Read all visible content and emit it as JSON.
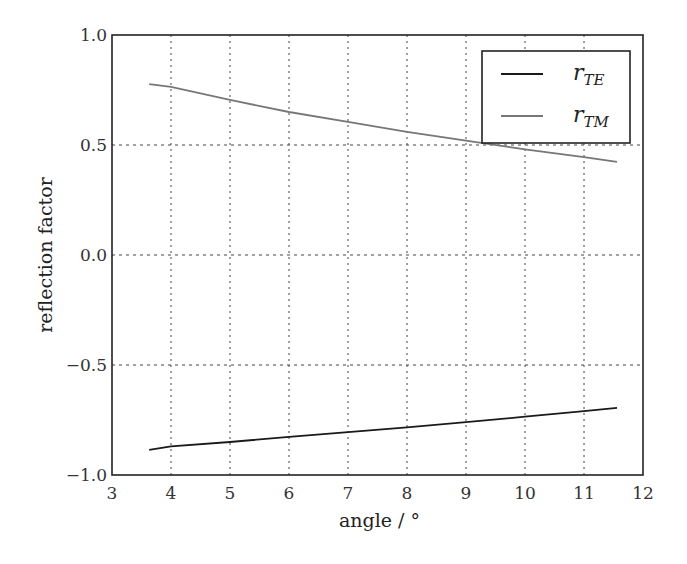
{
  "chart_data": {
    "type": "line",
    "title": "",
    "xlabel": "angle / °",
    "ylabel": "reflection factor",
    "xlim": [
      3,
      12
    ],
    "ylim": [
      -1.0,
      1.0
    ],
    "xticks": [
      "3",
      "4",
      "5",
      "6",
      "7",
      "8",
      "9",
      "10",
      "11",
      "12"
    ],
    "yticks": [
      "1.0",
      "0.5",
      "0.0",
      "−0.5",
      "−1.0"
    ],
    "grid": true,
    "legend_position": "upper right",
    "series": [
      {
        "name": "r_TE",
        "label_main": "r",
        "label_sub": "TE",
        "color": "#1a1a1a",
        "x": [
          3.63,
          4,
          5,
          6,
          7,
          8,
          9,
          10,
          11,
          11.56
        ],
        "y": [
          -0.886,
          -0.87,
          -0.85,
          -0.827,
          -0.805,
          -0.783,
          -0.76,
          -0.735,
          -0.71,
          -0.695
        ]
      },
      {
        "name": "r_TM",
        "label_main": "r",
        "label_sub": "TM",
        "color": "#777777",
        "x": [
          3.63,
          4,
          5,
          6,
          7,
          8,
          9,
          10,
          11,
          11.56
        ],
        "y": [
          0.777,
          0.764,
          0.705,
          0.65,
          0.605,
          0.56,
          0.52,
          0.48,
          0.445,
          0.423
        ]
      }
    ]
  }
}
